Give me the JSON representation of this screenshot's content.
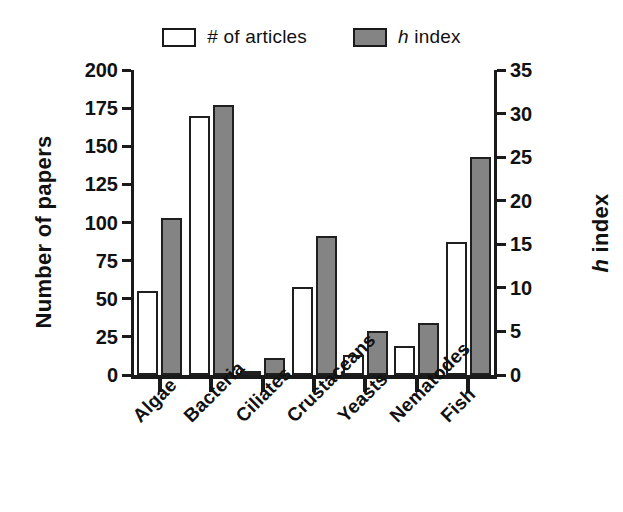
{
  "chart_data": {
    "type": "bar",
    "title": "",
    "categories": [
      "Algae",
      "Bacteria",
      "Ciliates",
      "Crustaceans",
      "Yeasts",
      "Nematodes",
      "Fish"
    ],
    "series": [
      {
        "name": "# of articles",
        "axis": "left",
        "color": "#ffffff",
        "edge_color": "#1f1f1f",
        "values": [
          55,
          170,
          2,
          58,
          13,
          19,
          87
        ]
      },
      {
        "name": "h index",
        "axis": "right",
        "color": "#848484",
        "edge_color": "#1f1f1f",
        "values": [
          18,
          31,
          2,
          16,
          5,
          6,
          25
        ]
      }
    ],
    "xlabel": "",
    "ylabel": "Number of papers",
    "ylabel_right": "h index",
    "ylim": [
      0,
      200
    ],
    "ylim_right": [
      0,
      35
    ],
    "yticks": [
      0,
      25,
      50,
      75,
      100,
      125,
      150,
      175,
      200
    ],
    "yticks_right": [
      0,
      5,
      10,
      15,
      20,
      25,
      30,
      35
    ],
    "grid": false,
    "legend_position": "top-center",
    "xtick_label_rotation": -45
  },
  "legend": {
    "entries": [
      {
        "label_text": "# of articles",
        "swatch": "white-square-icon"
      },
      {
        "label_italic": "h",
        "label_rest": " index",
        "swatch": "gray-square-icon"
      }
    ]
  },
  "axes": {
    "left_title": "Number of papers",
    "right_title_italic": "h",
    "right_title_rest": " index",
    "left_ticklabels": [
      "200",
      "175",
      "150",
      "125",
      "100",
      "75",
      "50",
      "25",
      "0"
    ],
    "right_ticklabels": [
      "35",
      "30",
      "25",
      "20",
      "15",
      "10",
      "5",
      "0"
    ]
  },
  "colors": {
    "articles_fill": "#ffffff",
    "hindex_fill": "#848484",
    "axis": "#1a1a1a",
    "background": "#ffffff"
  }
}
